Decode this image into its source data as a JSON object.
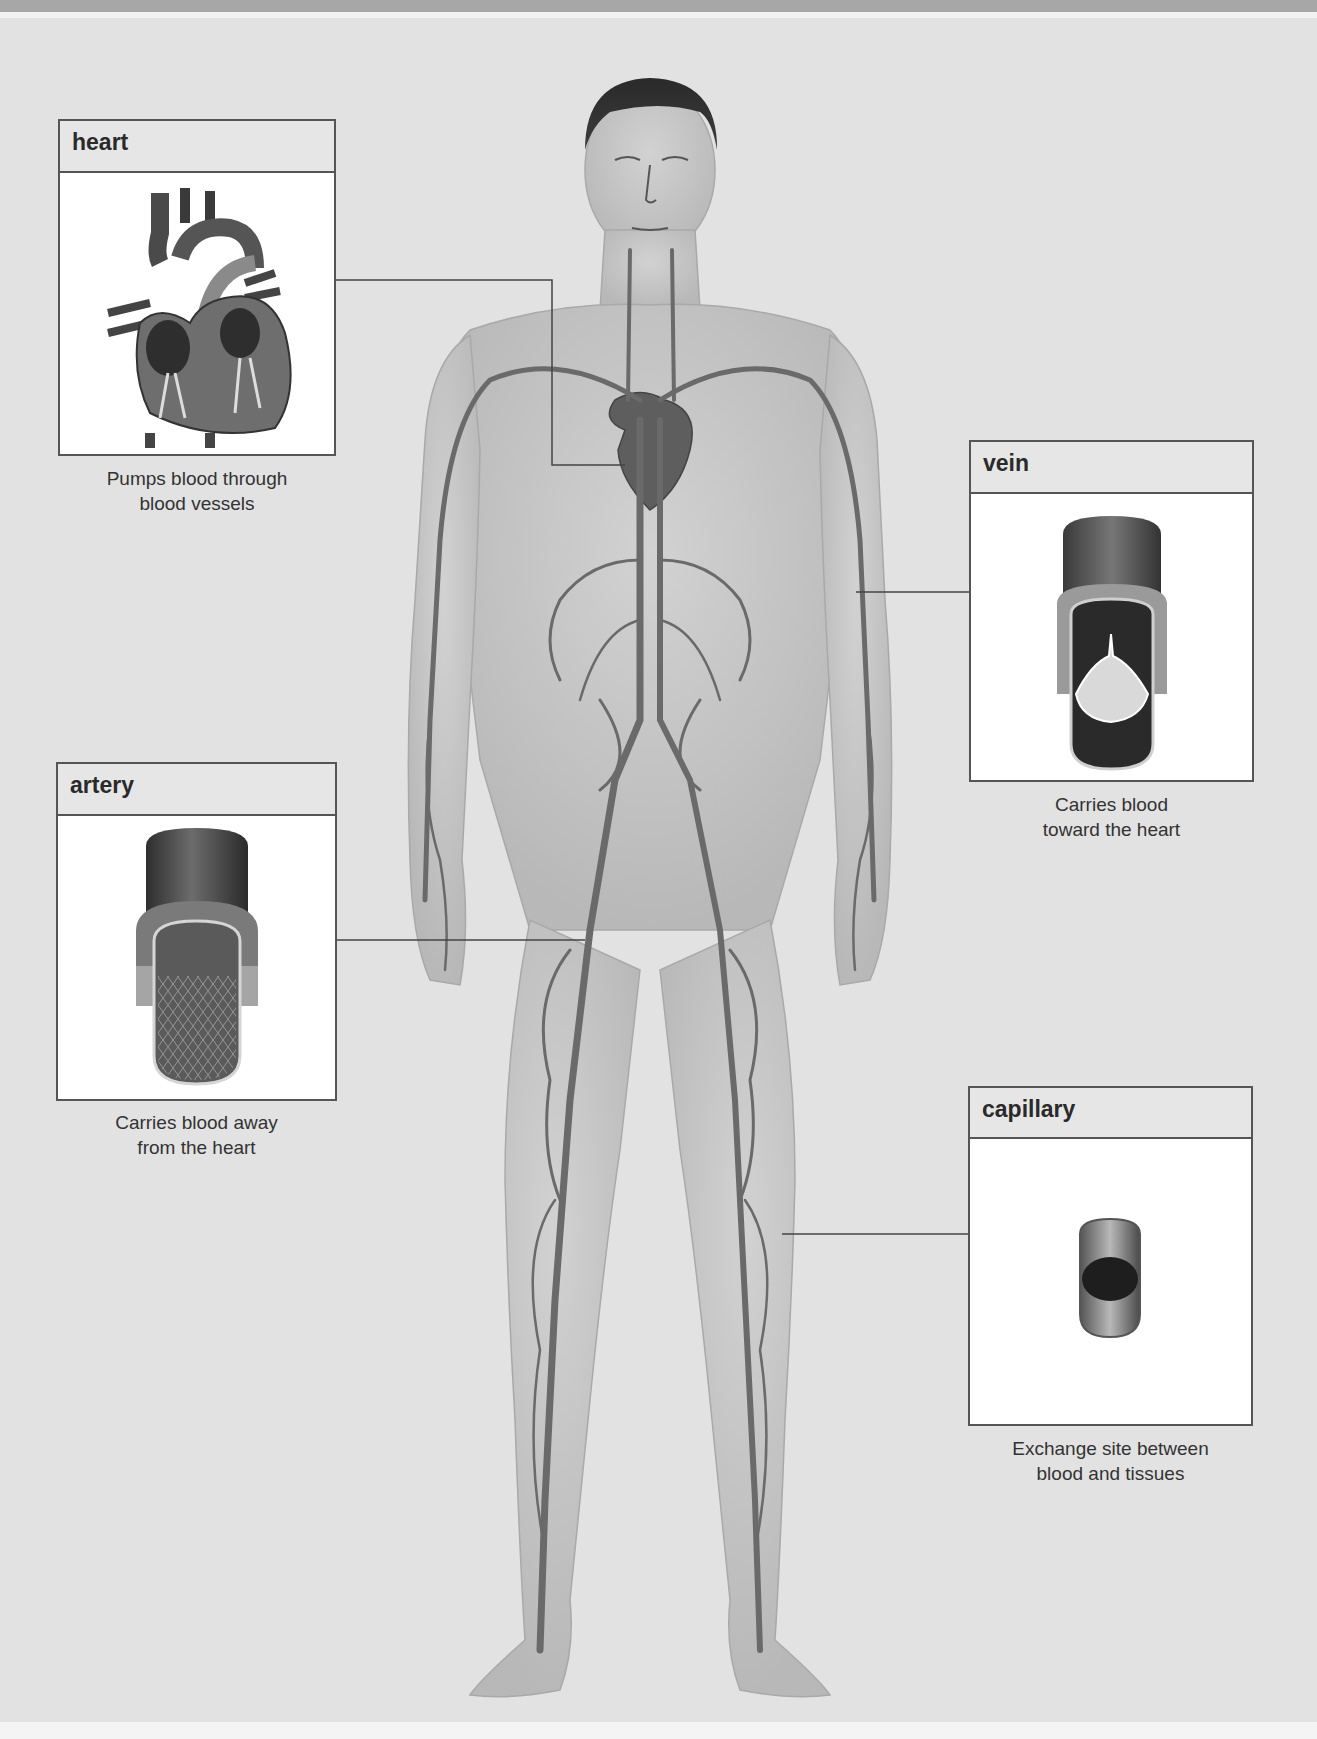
{
  "diagram": {
    "colors": {
      "background": "#e2e2e2",
      "box_border": "#555555",
      "box_header": "#e6e6e6",
      "vessel": "#6a6a6a",
      "skin": "#c9c9c9"
    },
    "callouts": [
      {
        "id": "heart",
        "title": "heart",
        "caption_line1": "Pumps blood through",
        "caption_line2": "blood vessels",
        "icon": "heart-cross-section-icon"
      },
      {
        "id": "vein",
        "title": "vein",
        "caption_line1": "Carries blood",
        "caption_line2": "toward the heart",
        "icon": "vein-valve-icon"
      },
      {
        "id": "artery",
        "title": "artery",
        "caption_line1": "Carries blood away",
        "caption_line2": "from the heart",
        "icon": "artery-cutaway-icon"
      },
      {
        "id": "capillary",
        "title": "capillary",
        "caption_line1": "Exchange site between",
        "caption_line2": "blood and tissues",
        "icon": "capillary-icon"
      }
    ]
  }
}
